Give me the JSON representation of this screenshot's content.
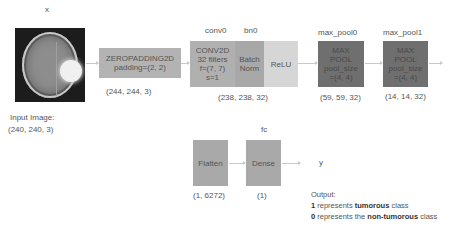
{
  "input": {
    "var_label": "x",
    "image_label": "Input Image:",
    "shape": "(240, 240, 3)",
    "image_alt": "brain MRI scan with tumor"
  },
  "zeropad": {
    "title": "ZEROPADDING2D",
    "param": "padding=(2, 2)",
    "shape": "(244, 244, 3)"
  },
  "conv": {
    "name_label": "conv0",
    "title": "CONV2D",
    "line2": "32 filters",
    "line3": "f=(7, 7)",
    "line4": "s=1"
  },
  "bn": {
    "name_label": "bn0",
    "line1": "Batch",
    "line2": "Norm"
  },
  "relu": {
    "label": "ReLU"
  },
  "conv_block_shape": "(238, 238, 32)",
  "pool0": {
    "name_label": "max_pool0",
    "line1": "MAX",
    "line2": "POOL",
    "line3": "pool_size",
    "line4": "=(4, 4)",
    "shape": "(59, 59, 32)"
  },
  "pool1": {
    "name_label": "max_pool1",
    "line1": "MAX",
    "line2": "POOL",
    "line3": "pool_size",
    "line4": "=(4, 4)",
    "shape": "(14, 14, 32)"
  },
  "flatten": {
    "label": "Flatten",
    "shape": "(1, 6272)"
  },
  "dense": {
    "name_label": "fc",
    "label": "Dense",
    "shape": "(1)"
  },
  "output": {
    "var_label": "y",
    "heading": "Output:",
    "line1_num": "1",
    "line1_pre": " represents ",
    "line1_bold": "tumorous",
    "line1_post": " class",
    "line2_num": "0",
    "line2_pre": " represents the ",
    "line2_bold": "non-tumorous",
    "line2_post": " class"
  },
  "colors": {
    "pad_box": "#b3b3b3",
    "conv_box": "#b0b0b0",
    "bn_box": "#a8a8a8",
    "relu_box": "#d6d6d6",
    "pool_box": "#6f6f6f",
    "fc_box": "#a9a9a9",
    "arrow": "#c9c9c9"
  }
}
